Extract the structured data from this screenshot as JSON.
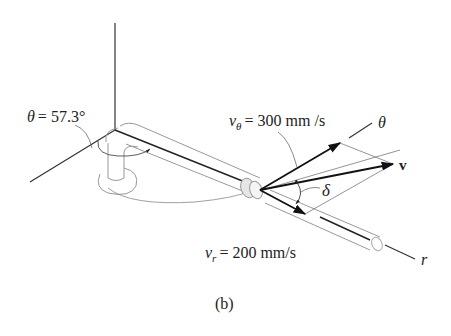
{
  "figure": {
    "caption": "(b)",
    "labels": {
      "theta_angle": "θ = 57.3°",
      "v_theta_sym": "v",
      "v_theta_sub": "θ",
      "v_theta_value": "= 300 mm /s",
      "v_r_sym": "v",
      "v_r_sub": "r",
      "v_r_value": "= 200 mm/s",
      "theta_axis": "θ",
      "velocity": "v",
      "delta": "δ",
      "r_axis": "r"
    },
    "quantities": {
      "theta_deg": 57.3,
      "v_theta_mm_s": 300,
      "v_r_mm_s": 200
    }
  }
}
